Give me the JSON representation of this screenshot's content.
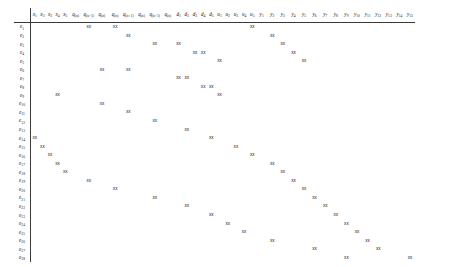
{
  "document": {
    "kind": "sparse-structure-matrix",
    "marker_glyph": "x",
    "row_count": 28,
    "column_count": 38,
    "row_labels": [
      "e1",
      "e2",
      "e3",
      "e4",
      "e5",
      "e6",
      "e7",
      "e8",
      "e9",
      "e10",
      "e11",
      "e12",
      "e13",
      "e14",
      "e15",
      "e16",
      "e17",
      "e18",
      "e19",
      "e20",
      "e21",
      "e22",
      "e23",
      "e24",
      "e25",
      "e26",
      "e27",
      "e28"
    ],
    "column_labels": [
      "x1",
      "x2",
      "x3",
      "x4",
      "x5",
      "q(n)",
      "q(n+1)",
      "q(n)",
      "q(n)",
      "q(n+1)",
      "q(n)",
      "q(n+1)",
      "q(n)",
      "d1",
      "d2",
      "d3",
      "d4",
      "d5",
      "u1",
      "u2",
      "u3",
      "u4",
      "u5",
      "y1",
      "y2",
      "y3",
      "y4",
      "y5",
      "y6",
      "y7",
      "y8",
      "y9",
      "y10",
      "y11",
      "y12",
      "y13",
      "y14",
      "y15"
    ],
    "column_groups": [
      {
        "name": "x",
        "label": "x",
        "start": 0,
        "count": 5
      },
      {
        "name": "q",
        "label": "q",
        "start": 5,
        "count": 8
      },
      {
        "name": "d",
        "label": "d",
        "start": 13,
        "count": 5
      },
      {
        "name": "u",
        "label": "u",
        "start": 18,
        "count": 5
      },
      {
        "name": "y",
        "label": "y",
        "start": 23,
        "count": 15
      }
    ],
    "marks": [
      [
        0,
        6,
        8,
        22
      ],
      [
        1,
        9,
        24
      ],
      [
        2,
        11,
        13,
        25
      ],
      [
        3,
        15,
        16,
        26
      ],
      [
        4,
        18,
        27
      ],
      [
        5,
        7,
        9
      ],
      [
        6,
        13,
        14
      ],
      [
        7,
        16,
        17
      ],
      [
        8,
        3,
        18
      ],
      [
        9,
        7
      ],
      [
        10,
        9
      ],
      [
        11,
        11
      ],
      [
        12,
        14
      ],
      [
        13,
        0,
        17
      ],
      [
        14,
        1,
        20
      ],
      [
        15,
        2,
        22
      ],
      [
        16,
        3,
        24
      ],
      [
        17,
        4,
        25
      ],
      [
        18,
        6,
        26
      ],
      [
        19,
        8,
        27
      ],
      [
        20,
        11,
        28
      ],
      [
        21,
        14,
        29
      ],
      [
        22,
        17,
        30
      ],
      [
        23,
        19,
        31
      ],
      [
        24,
        21,
        32
      ],
      [
        25,
        24,
        33
      ],
      [
        26,
        28,
        34
      ],
      [
        27,
        31,
        37
      ]
    ],
    "styles": {
      "ink": "#161616",
      "rule": "#3a3a3a",
      "paper": "#ffffff"
    }
  }
}
